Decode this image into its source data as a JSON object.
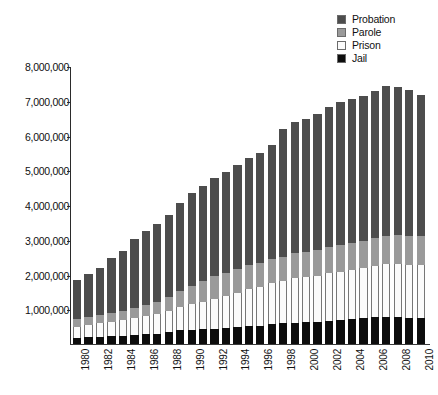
{
  "chart_data": {
    "type": "bar",
    "subtype": "stacked-bar",
    "title": "",
    "subtitle": "",
    "xlabel": "",
    "ylabel": "",
    "grid": false,
    "legend_position": "top-right",
    "ylim": [
      0,
      8000000
    ],
    "ytick_values": [
      0,
      1000000,
      2000000,
      3000000,
      4000000,
      5000000,
      6000000,
      7000000,
      8000000
    ],
    "ytick_labels": [
      "",
      "1,000,000",
      "2,000,000",
      "3,000,000",
      "4,000,000",
      "5,000,000",
      "6,000,000",
      "7,000,000",
      "8,000,000"
    ],
    "categories": [
      "1980",
      "1981",
      "1982",
      "1983",
      "1984",
      "1985",
      "1986",
      "1987",
      "1988",
      "1989",
      "1990",
      "1991",
      "1992",
      "1993",
      "1994",
      "1995",
      "1996",
      "1997",
      "1998",
      "1999",
      "2000",
      "2001",
      "2002",
      "2003",
      "2004",
      "2005",
      "2006",
      "2007",
      "2008",
      "2009",
      "2010"
    ],
    "xtick_labels_shown": [
      "1980",
      "1982",
      "1984",
      "1986",
      "1988",
      "1990",
      "1992",
      "1994",
      "1996",
      "1998",
      "2000",
      "2002",
      "2004",
      "2006",
      "2008",
      "2010"
    ],
    "stack_order_bottom_to_top": [
      "Jail",
      "Prison",
      "Parole",
      "Probation"
    ],
    "series": [
      {
        "name": "Jail",
        "color": "#0d0d0d",
        "values": [
          182288,
          196785,
          209582,
          223551,
          234500,
          256615,
          274444,
          295873,
          343569,
          395553,
          405320,
          426479,
          444584,
          459804,
          486474,
          507044,
          518492,
          567079,
          592462,
          605943,
          621149,
          631240,
          665475,
          691301,
          713990,
          747529,
          765819,
          780174,
          785533,
          760400,
          748728
        ]
      },
      {
        "name": "Prison",
        "color": "#fbfbfb",
        "values": [
          319598,
          360029,
          402914,
          423898,
          448264,
          487593,
          526436,
          562814,
          607766,
          683367,
          743382,
          792535,
          850566,
          909381,
          990147,
          1078542,
          1127528,
          1176564,
          1224469,
          1287172,
          1316333,
          1330007,
          1367547,
          1390279,
          1421345,
          1448344,
          1492973,
          1517867,
          1518559,
          1524513,
          1518104
        ]
      },
      {
        "name": "Parole",
        "color": "#9a9a9a",
        "values": [
          220438,
          225539,
          224604,
          246440,
          266992,
          300203,
          325638,
          355505,
          407977,
          456803,
          531407,
          590442,
          658601,
          676100,
          690371,
          679421,
          679733,
          694787,
          696385,
          714457,
          723898,
          732333,
          750934,
          769925,
          771852,
          780616,
          798202,
          821177,
          828169,
          824365,
          840676
        ]
      },
      {
        "name": "Probation",
        "color": "#4d4d4d",
        "values": [
          1118097,
          1225934,
          1357264,
          1582947,
          1740948,
          1968712,
          2114621,
          2247158,
          2356483,
          2522125,
          2670234,
          2728472,
          2811611,
          2903061,
          2981022,
          3077861,
          3164996,
          3296513,
          3670441,
          3779922,
          3826209,
          3931731,
          4024067,
          4120012,
          4143792,
          4162536,
          4236800,
          4293163,
          4271487,
          4203967,
          4055514
        ]
      }
    ],
    "totals": [
      1840421,
      2008287,
      2194364,
      2476836,
      2690704,
      3013123,
      3241139,
      3461350,
      3715795,
      4057848,
      4350343,
      4537928,
      4765362,
      4948346,
      5148014,
      5342868,
      5490749,
      5734943,
      6183757,
      6387494,
      6487589,
      6625311,
      6808023,
      6971517,
      7050979,
      7139025,
      7293794,
      7412381,
      7403748,
      7313245,
      7163022
    ]
  },
  "legend": {
    "items": [
      {
        "label": "Probation",
        "color": "#4d4d4d"
      },
      {
        "label": "Parole",
        "color": "#9a9a9a"
      },
      {
        "label": "Prison",
        "color": "#fbfbfb"
      },
      {
        "label": "Jail",
        "color": "#0d0d0d"
      }
    ]
  }
}
